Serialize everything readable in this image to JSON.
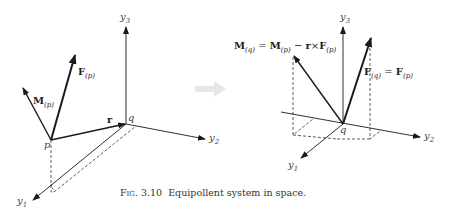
{
  "figure": {
    "caption_label": "Fig. 3.10",
    "caption_text": "Equipollent system in space."
  },
  "left_diagram": {
    "axes": {
      "y1": "y",
      "y1_sub": "1",
      "y2": "y",
      "y2_sub": "2",
      "y3": "y",
      "y3_sub": "3"
    },
    "points": {
      "p": "p",
      "q": "q"
    },
    "vectors": {
      "force": {
        "symbol": "F",
        "sub": "(p)"
      },
      "moment": {
        "symbol": "M",
        "sub": "(p)"
      },
      "position": {
        "symbol": "r"
      }
    }
  },
  "right_diagram": {
    "axes": {
      "y1": "y",
      "y1_sub": "1",
      "y2": "y",
      "y2_sub": "2",
      "y3": "y",
      "y3_sub": "3"
    },
    "points": {
      "q": "q"
    },
    "vectors": {
      "force_eq": {
        "lhs": "F",
        "lhs_sub": "(q)",
        "eq": " = ",
        "rhs": "F",
        "rhs_sub": "(p)"
      },
      "moment_eq": {
        "lhs": "M",
        "lhs_sub": "(q)",
        "eq": " = ",
        "m": "M",
        "m_sub": "(p)",
        "minus": " − ",
        "r": "r",
        "cross": "×",
        "f": "F",
        "f_sub": "(p)"
      }
    }
  },
  "transition_arrow": {
    "color": "#e6e6e6"
  },
  "colors": {
    "line": "#1a1a1a",
    "text": "#333333"
  }
}
